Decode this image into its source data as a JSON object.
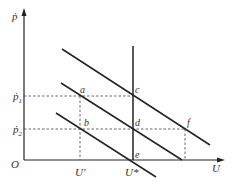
{
  "diagram": {
    "type": "economics-phillips-curve",
    "axes": {
      "y_label": "ṗ",
      "x_label": "U",
      "origin_label": "O"
    },
    "y_ticks": [
      {
        "label": "ṗ",
        "sub": "1"
      },
      {
        "label": "ṗ",
        "sub": "2"
      }
    ],
    "x_ticks": [
      {
        "label": "U'"
      },
      {
        "label": "U*"
      }
    ],
    "points": [
      {
        "label": "a"
      },
      {
        "label": "b"
      },
      {
        "label": "c"
      },
      {
        "label": "d"
      },
      {
        "label": "e"
      },
      {
        "label": "f"
      }
    ],
    "curves": [
      {
        "name": "short-run-phillips-curve-top"
      },
      {
        "name": "short-run-phillips-curve-middle"
      },
      {
        "name": "short-run-phillips-curve-bottom"
      },
      {
        "name": "long-run-phillips-curve-vertical"
      }
    ],
    "colors": {
      "line": "#222222",
      "dashed": "#555555",
      "text": "#333333"
    }
  }
}
